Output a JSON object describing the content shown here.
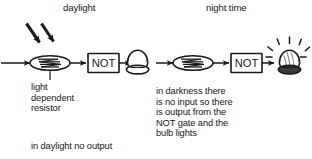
{
  "figure": {
    "kind": "electronics-circuit-diagram",
    "background_color": "#ffffff",
    "ink_color": "#1a1a1a",
    "panels": [
      {
        "id": "daylight",
        "title": "daylight",
        "light_present": true,
        "bulb_lit": false,
        "note": "in daylight no output",
        "component_caption": "light\ndependent\nresistor"
      },
      {
        "id": "night-time",
        "title": "night time",
        "light_present": false,
        "bulb_lit": true,
        "note": "in darkness there\nis no input so there\nis output from the\nNOT gate and the\nbulb lights"
      }
    ],
    "components": {
      "ldr_label": "light dependent resistor",
      "not_gate_label": "NOT",
      "lamp_label": "bulb"
    },
    "icons": {
      "light_rays": "light-rays-icon",
      "ldr": "ldr-icon",
      "not_gate": "not-gate-icon",
      "lamp_off": "lamp-off-icon",
      "lamp_on": "lamp-on-icon",
      "wire_arrow": "wire-arrow-icon"
    }
  }
}
